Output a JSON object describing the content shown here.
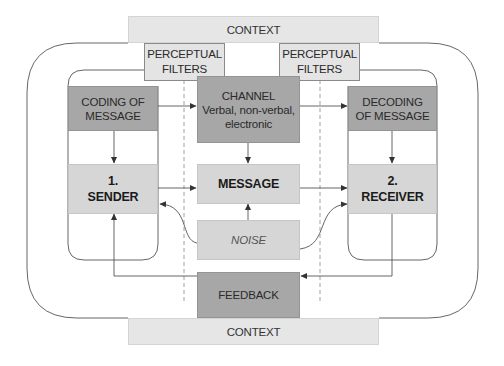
{
  "diagram": {
    "context_top": "CONTEXT",
    "context_bottom": "CONTEXT",
    "filters": [
      {
        "line1": "PERCEPTUAL",
        "line2": "FILTERS"
      },
      {
        "line1": "PERCEPTUAL",
        "line2": "FILTERS"
      }
    ],
    "coding": {
      "line1": "CODING OF",
      "line2": "MESSAGE"
    },
    "decoding": {
      "line1": "DECODING",
      "line2": "OF MESSAGE"
    },
    "channel": {
      "line1": "CHANNEL",
      "line2": "Verbal, non-verbal,",
      "line3": "electronic"
    },
    "sender": {
      "number": "1.",
      "label": "SENDER"
    },
    "receiver": {
      "number": "2.",
      "label": "RECEIVER"
    },
    "message": "MESSAGE",
    "noise": "NOISE",
    "feedback": "FEEDBACK",
    "colors": {
      "dark_box": "#a7a7a7",
      "light_box": "#d6d6d6",
      "context": "#e6e6e6",
      "line": "#555555"
    }
  }
}
